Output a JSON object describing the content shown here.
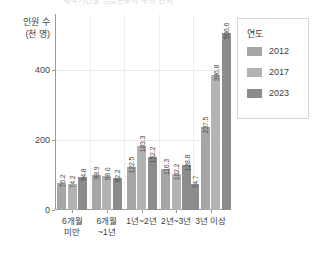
{
  "chart_data": {
    "type": "bar",
    "title": "재직기간별 임금근로자 수의 변화",
    "xlabel": "",
    "ylabel": "인원 수\n(천 명)",
    "ylabel_line1": "인원 수",
    "ylabel_line2": "(천 명)",
    "categories": [
      "6개월\n미만",
      "6개월\n~1년",
      "1년~2년",
      "2년~3년",
      "3년 이상"
    ],
    "series": [
      {
        "name": "2012",
        "color": "#a6a6a6",
        "values": [
          76.2,
          98.9,
          183.3,
          102.2,
          237.5
        ]
      },
      {
        "name": "2017",
        "color": "#b3b3b3",
        "values": [
          74.2,
          98.0,
          152.2,
          128.8,
          386.8
        ]
      },
      {
        "name": "2023",
        "color": "#8c8c8c",
        "values": [
          94.8,
          92.2,
          116.3,
          74.7,
          506.6
        ]
      }
    ],
    "grouped_values": [
      {
        "category": "6개월\n미만",
        "values": [
          76.2,
          74.2,
          94.8
        ]
      },
      {
        "category": "6개월\n~1년",
        "values": [
          98.9,
          98.0,
          92.2
        ]
      },
      {
        "category": "1년~2년",
        "values": [
          122.5,
          183.3,
          152.2
        ]
      },
      {
        "category": "2년~3년",
        "values": [
          116.3,
          102.2,
          128.8
        ]
      },
      {
        "category": "3년 이상",
        "values": [
          74.7,
          237.5,
          386.8,
          506.6
        ]
      }
    ],
    "bars": [
      {
        "group": 0,
        "series": 0,
        "value": 76.2
      },
      {
        "group": 0,
        "series": 1,
        "value": 74.2
      },
      {
        "group": 0,
        "series": 2,
        "value": 94.8
      },
      {
        "group": 1,
        "series": 0,
        "value": 98.9
      },
      {
        "group": 1,
        "series": 1,
        "value": 98.0
      },
      {
        "group": 1,
        "series": 2,
        "value": 92.2
      },
      {
        "group": 2,
        "series": 0,
        "value": 122.5
      },
      {
        "group": 2,
        "series": 1,
        "value": 183.3
      },
      {
        "group": 2,
        "series": 2,
        "value": 152.2
      },
      {
        "group": 3,
        "series": 0,
        "value": 116.3
      },
      {
        "group": 3,
        "series": 1,
        "value": 102.2
      },
      {
        "group": 3,
        "series": 2,
        "value": 128.8
      },
      {
        "group": 4,
        "series": 0,
        "value": 74.7
      },
      {
        "group": 4,
        "series": 1,
        "value": 237.5
      },
      {
        "group": 4,
        "series": 2,
        "value": 386.8
      },
      {
        "group": 4,
        "series": 3,
        "value": 506.6
      }
    ],
    "yticks": [
      0,
      200,
      400
    ],
    "ylim": [
      0,
      560
    ],
    "grid": "horizontal-and-vertical",
    "legend": {
      "title": "연도",
      "position": "right",
      "entries": [
        "2012",
        "2017",
        "2023"
      ]
    }
  },
  "legend": {
    "title": "연도",
    "items": [
      {
        "label": "2012",
        "color": "#a6a6a6"
      },
      {
        "label": "2017",
        "color": "#b3b3b3"
      },
      {
        "label": "2023",
        "color": "#8c8c8c"
      }
    ]
  },
  "axis": {
    "y_title_line1": "인원 수",
    "y_title_line2": "(천 명)",
    "yticks": [
      "0",
      "200",
      "400"
    ]
  }
}
